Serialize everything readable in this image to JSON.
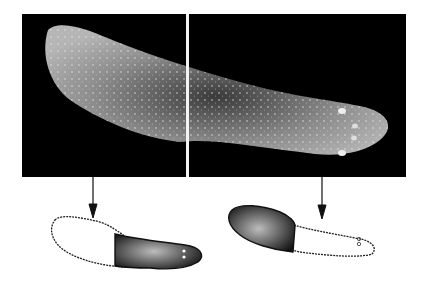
{
  "figure": {
    "top_panels": [
      {
        "id": "left",
        "content": "photograph of worm body, anterior (left) half"
      },
      {
        "id": "right",
        "content": "photograph of worm body, posterior with head and eyespots (right)"
      }
    ],
    "bottom_drawings": [
      {
        "id": "left-drawing",
        "shading": "white anterior, dark stippled posterior with eyespots at right end"
      },
      {
        "id": "right-drawing",
        "shading": "dark stippled anterior, white posterior with eyespots at right end"
      }
    ],
    "arrows": 2,
    "colors": {
      "background": "#ffffff",
      "panel": "#000000",
      "worm": "#9a9a9a",
      "ink": "#111111"
    }
  }
}
